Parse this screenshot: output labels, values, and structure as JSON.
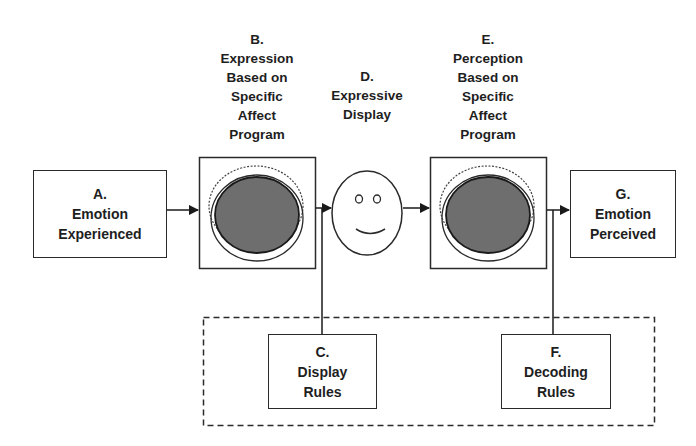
{
  "diagram": {
    "type": "flow",
    "colors": {
      "stroke": "#2a2a2a",
      "program_fill": "#6e6e6e",
      "background": "#ffffff"
    },
    "nodes": {
      "A": {
        "letter": "A.",
        "lines": [
          "Emotion",
          "Experienced"
        ]
      },
      "B": {
        "letter": "B.",
        "lines": [
          "Expression",
          "Based on",
          "Specific",
          "Affect",
          "Program"
        ],
        "icon": "affect-program-icon"
      },
      "C": {
        "letter": "C.",
        "lines": [
          "Display",
          "Rules"
        ]
      },
      "D": {
        "letter": "D.",
        "lines": [
          "Expressive",
          "Display"
        ],
        "icon": "smiley-face-icon"
      },
      "E": {
        "letter": "E.",
        "lines": [
          "Perception",
          "Based on",
          "Specific",
          "Affect",
          "Program"
        ],
        "icon": "affect-program-icon"
      },
      "F": {
        "letter": "F.",
        "lines": [
          "Decoding",
          "Rules"
        ]
      },
      "G": {
        "letter": "G.",
        "lines": [
          "Emotion",
          "Perceived"
        ]
      }
    },
    "edges": [
      {
        "from": "A",
        "to": "B",
        "type": "arrow"
      },
      {
        "from": "B",
        "to": "D",
        "type": "arrow"
      },
      {
        "from": "D",
        "to": "E",
        "type": "arrow"
      },
      {
        "from": "E",
        "to": "G",
        "type": "arrow"
      },
      {
        "from": "C",
        "to": "B-D link",
        "type": "line"
      },
      {
        "from": "F",
        "to": "E-G link",
        "type": "line"
      }
    ],
    "groups": [
      {
        "name": "rules-group",
        "members": [
          "C",
          "F"
        ],
        "style": "dashed"
      }
    ]
  }
}
